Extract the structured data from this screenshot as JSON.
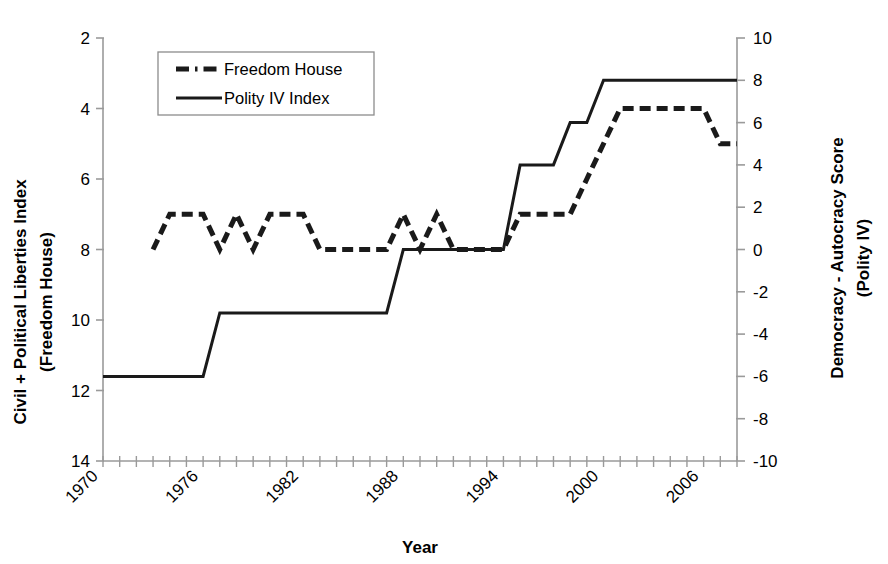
{
  "chart_data": {
    "type": "line",
    "title": "",
    "xlabel": "Year",
    "ylabel_left": "Civil + Political Liberties Index (Freedom House)",
    "ylabel_left_line1": "Civil + Political Liberties Index",
    "ylabel_left_line2": "(Freedom House)",
    "ylabel_right": "Democracy - Autocracy Score (Polity IV)",
    "ylabel_right_line1": "Democracy - Autocracy Score",
    "ylabel_right_line2": "(Polity IV)",
    "xlim": [
      1970,
      2008
    ],
    "xticks_labeled": [
      1970,
      1976,
      1982,
      1988,
      1994,
      2000,
      2006
    ],
    "xtick_labels": [
      "1970",
      "1976",
      "1982",
      "1988",
      "1994",
      "2000",
      "2006"
    ],
    "xtick_interval_minor": 1,
    "ylim_left": [
      14,
      2
    ],
    "yticks_left": [
      2,
      4,
      6,
      8,
      10,
      12,
      14
    ],
    "ytick_labels_left": [
      "2",
      "4",
      "6",
      "8",
      "10",
      "12",
      "14"
    ],
    "ylim_right": [
      -10,
      10
    ],
    "yticks_right": [
      10,
      8,
      6,
      4,
      2,
      0,
      -2,
      -4,
      -6,
      -8,
      -10
    ],
    "ytick_labels_right": [
      "10",
      "8",
      "6",
      "4",
      "2",
      "0",
      "-2",
      "-4",
      "-6",
      "-8",
      "-10"
    ],
    "left_axis_inverted": true,
    "grid": false,
    "legend_position": "top-left-inside",
    "series": [
      {
        "name": "Freedom House",
        "style": "dashed",
        "axis": "left",
        "color": "#000000",
        "x": [
          1973,
          1974,
          1975,
          1976,
          1977,
          1978,
          1979,
          1980,
          1981,
          1982,
          1983,
          1984,
          1985,
          1986,
          1987,
          1988,
          1989,
          1990,
          1991,
          1992,
          1993,
          1994,
          1995,
          1996,
          1997,
          1998,
          1999,
          2000,
          2001,
          2002,
          2003,
          2004,
          2005,
          2006,
          2007,
          2008
        ],
        "values": [
          8,
          7,
          7,
          7,
          8,
          7,
          8,
          7,
          7,
          7,
          8,
          8,
          8,
          8,
          8,
          7,
          8,
          7,
          8,
          8,
          8,
          8,
          7,
          7,
          7,
          7,
          6,
          5,
          4,
          4,
          4,
          4,
          4,
          4,
          5,
          5
        ]
      },
      {
        "name": "Polity IV Index",
        "style": "solid",
        "axis": "right",
        "color": "#000000",
        "x": [
          1970,
          1971,
          1972,
          1973,
          1974,
          1975,
          1976,
          1977,
          1978,
          1979,
          1980,
          1981,
          1982,
          1983,
          1984,
          1985,
          1986,
          1987,
          1988,
          1989,
          1990,
          1991,
          1992,
          1993,
          1994,
          1995,
          1996,
          1997,
          1998,
          1999,
          2000,
          2001,
          2002,
          2003,
          2004,
          2005,
          2006,
          2007,
          2008
        ],
        "values": [
          -6,
          -6,
          -6,
          -6,
          -6,
          -6,
          -6,
          -3,
          -3,
          -3,
          -3,
          -3,
          -3,
          -3,
          -3,
          -3,
          -3,
          -3,
          0,
          0,
          0,
          0,
          0,
          0,
          0,
          4,
          4,
          4,
          6,
          6,
          8,
          8,
          8,
          8,
          8,
          8,
          8,
          8,
          8
        ]
      }
    ]
  },
  "legend": {
    "items": [
      {
        "label": "Freedom House",
        "style": "dashed"
      },
      {
        "label": "Polity IV Index",
        "style": "solid"
      }
    ]
  },
  "axes": {
    "x_title": "Year",
    "left_title_line1": "Civil + Political Liberties Index",
    "left_title_line2": "(Freedom House)",
    "right_title_line1": "Democracy - Autocracy Score",
    "right_title_line2": "(Polity IV)"
  },
  "colors": {
    "line": "#1a1a1a",
    "axis": "#808080",
    "background": "#ffffff"
  }
}
